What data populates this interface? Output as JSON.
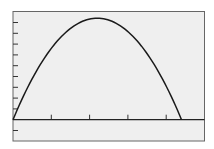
{
  "chart_data": {
    "type": "line",
    "title": "",
    "xlabel": "",
    "ylabel": "",
    "x_ticks": [
      0,
      1,
      2,
      3,
      4
    ],
    "y_ticks": [
      -1,
      1,
      2,
      3,
      4,
      5,
      6,
      7,
      8,
      9
    ],
    "xlim": [
      0,
      5
    ],
    "ylim": [
      -2,
      10
    ],
    "grid": false,
    "legend": null,
    "series": [
      {
        "name": "parabola",
        "x": [
          0,
          0.5,
          1,
          1.5,
          2,
          2.2,
          2.5,
          3,
          3.5,
          4,
          4.4
        ],
        "y": [
          0,
          3.6,
          6.4,
          8.4,
          9.3,
          9.4,
          9.3,
          8.0,
          5.7,
          2.5,
          0
        ]
      }
    ],
    "colors": {
      "background": "#efefef",
      "line": "#1a1a1a",
      "frame": "#555555"
    }
  }
}
